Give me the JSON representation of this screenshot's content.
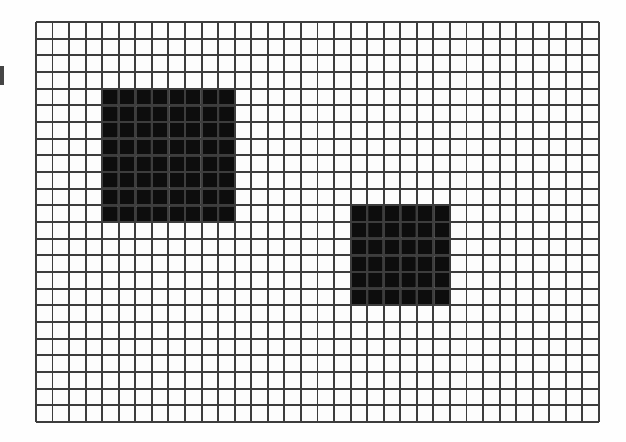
{
  "figure": {
    "background_color": "#fefefe",
    "page_color": "#ffffff"
  },
  "grid": {
    "origin_x": 35,
    "origin_y": 21,
    "columns": 34,
    "rows": 24,
    "cell_width": 16.56,
    "cell_height": 16.67,
    "line_color": "#3d3d3d",
    "line_width": 1.9,
    "cell_fill_color": "#fdfdfd",
    "total_width": 563,
    "total_height": 400
  },
  "shapes": [
    {
      "name": "large-filled-square",
      "label": "Large square",
      "col": 4,
      "row": 4,
      "cols_span": 8,
      "rows_span": 8,
      "cell_count": 64,
      "fill_color": "#0d0d0d",
      "separator_color": "#bdbdbd"
    },
    {
      "name": "small-filled-square",
      "label": "Small square",
      "col": 19,
      "row": 11,
      "cols_span": 6,
      "rows_span": 6,
      "cell_count": 36,
      "fill_color": "#0d0d0d",
      "separator_color": "#bdbdbd"
    }
  ],
  "artifact": {
    "name": "left-edge-mark",
    "color": "#2b2b2b"
  }
}
